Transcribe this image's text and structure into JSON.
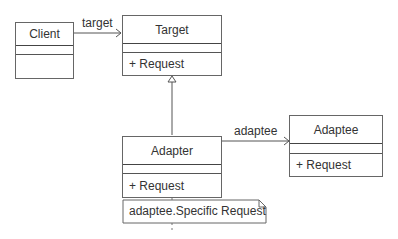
{
  "diagram": {
    "type": "uml-class-diagram",
    "pattern": "Adapter",
    "classes": [
      {
        "name": "Client",
        "attributes": [],
        "operations": []
      },
      {
        "name": "Target",
        "attributes": [],
        "operations": [
          "+ Request"
        ]
      },
      {
        "name": "Adapter",
        "attributes": [],
        "operations": [
          "+ Request"
        ]
      },
      {
        "name": "Adaptee",
        "attributes": [],
        "operations": [
          "+ Request"
        ]
      }
    ],
    "relations": [
      {
        "from": "Client",
        "to": "Target",
        "kind": "association",
        "label": "target"
      },
      {
        "from": "Adapter",
        "to": "Target",
        "kind": "generalization",
        "label": ""
      },
      {
        "from": "Adapter",
        "to": "Adaptee",
        "kind": "association",
        "label": "adaptee"
      }
    ],
    "note": {
      "text": "adaptee.Specific Request",
      "attached_to": "Adapter"
    },
    "colors": {
      "line": "#555555",
      "text": "#333333",
      "background": "#ffffff"
    }
  },
  "labels": {
    "client": "Client",
    "target": "Target",
    "adapter": "Adapter",
    "adaptee": "Adaptee",
    "target_op": "+ Request",
    "adapter_op": "+ Request",
    "adaptee_op": "+ Request",
    "assoc_target": "target",
    "assoc_adaptee": "adaptee",
    "note_text": "adaptee.Specific Request"
  }
}
